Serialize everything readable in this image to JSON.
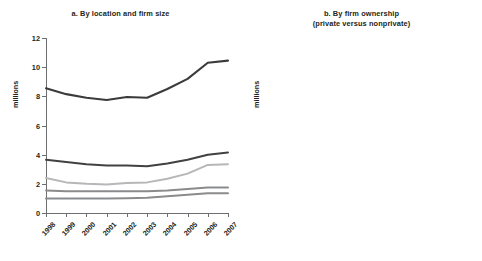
{
  "figure": {
    "ylabel": "millions",
    "panels": [
      {
        "id": "a",
        "title_line1": "a. By location and firm size",
        "title_line2": ""
      },
      {
        "id": "b",
        "title_line1": "b. By firm ownership",
        "title_line2": "(private versus nonprivate)"
      }
    ]
  },
  "chart_data": [
    {
      "type": "line",
      "title": "a. By location and firm size",
      "xlabel": "",
      "ylabel": "millions",
      "ylim": [
        0,
        12
      ],
      "yticks": [
        0,
        2,
        4,
        6,
        8,
        10,
        12
      ],
      "ytick_labels": [
        "0",
        "2",
        "4",
        "6",
        "8",
        "10",
        "12"
      ],
      "grid": false,
      "legend": "none",
      "categories": [
        "1998",
        "1999",
        "2000",
        "2001",
        "2002",
        "2003",
        "2004",
        "2005",
        "2006",
        "2007"
      ],
      "series": [
        {
          "name": "series-1",
          "color": "#3b3b3d",
          "width": 2.1,
          "values": [
            8.55,
            8.15,
            7.9,
            7.75,
            7.95,
            7.9,
            8.5,
            9.2,
            10.3,
            10.45
          ]
        },
        {
          "name": "series-2",
          "color": "#414143",
          "width": 2.0,
          "values": [
            3.65,
            3.5,
            3.35,
            3.25,
            3.25,
            3.2,
            3.4,
            3.65,
            4.0,
            4.15
          ]
        },
        {
          "name": "series-3",
          "color": "#b6b7b9",
          "width": 2.0,
          "values": [
            2.4,
            2.1,
            2.0,
            1.95,
            2.05,
            2.1,
            2.35,
            2.7,
            3.3,
            3.35
          ]
        },
        {
          "name": "series-4",
          "color": "#8a8b8d",
          "width": 2.0,
          "values": [
            1.55,
            1.5,
            1.5,
            1.5,
            1.5,
            1.5,
            1.55,
            1.65,
            1.75,
            1.75
          ]
        },
        {
          "name": "series-5",
          "color": "#8a8b8d",
          "width": 2.0,
          "values": [
            1.0,
            1.0,
            1.0,
            1.0,
            1.02,
            1.05,
            1.15,
            1.25,
            1.35,
            1.35
          ]
        }
      ]
    },
    {
      "type": "line",
      "title": "b. By firm ownership (private versus nonprivate)",
      "xlabel": "",
      "ylabel": "millions",
      "ylim": [
        0,
        12
      ],
      "yticks": [
        0,
        2,
        4,
        6,
        8,
        10,
        12
      ],
      "ytick_labels": [
        "0",
        "2",
        "4",
        "6",
        "8",
        "10",
        "12"
      ],
      "grid": false,
      "legend": "none",
      "categories": [
        "1998",
        "1999",
        "2000",
        "2001",
        "2002",
        "2003",
        "2004",
        "2005",
        "2006",
        "2007"
      ],
      "series": [
        {
          "name": "total",
          "color": "#3b3b3d",
          "width": 2.1,
          "values": [
            8.55,
            8.15,
            7.9,
            7.75,
            7.95,
            7.9,
            8.5,
            9.2,
            10.3,
            10.45
          ]
        },
        {
          "name": "private",
          "color": "#c6c7c9",
          "width": 2.1,
          "values": [
            7.25,
            7.0,
            6.85,
            6.8,
            7.0,
            7.05,
            7.85,
            8.6,
            10.1,
            10.2
          ]
        },
        {
          "name": "nonprivate",
          "color": "#8a8b8d",
          "width": 2.1,
          "values": [
            1.35,
            1.2,
            1.1,
            1.0,
            0.9,
            0.85,
            0.45,
            0.65,
            0.2,
            0.28
          ]
        }
      ]
    }
  ]
}
